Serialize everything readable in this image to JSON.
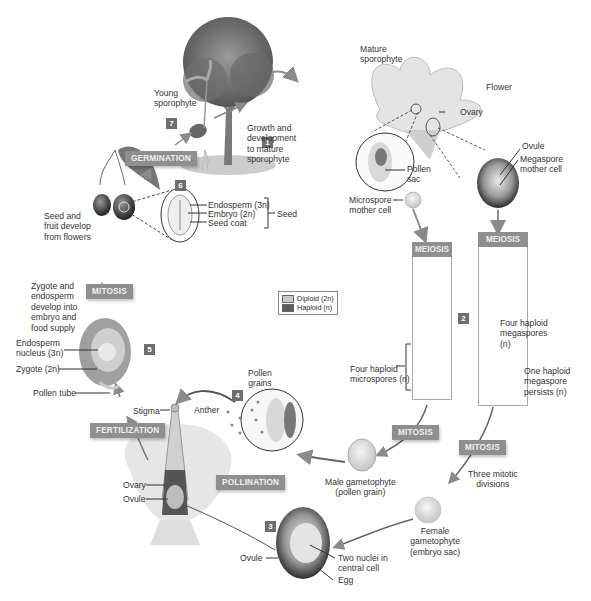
{
  "legend": {
    "items": [
      {
        "label": "Diploid (2n)",
        "color": "#c8c8c8"
      },
      {
        "label": "Haploid (n)",
        "color": "#5c5c5c"
      }
    ]
  },
  "steps": [
    "1",
    "2",
    "3",
    "4",
    "5",
    "6",
    "7"
  ],
  "processes": {
    "germination": "GERMINATION",
    "meiosis_left": "MEIOSIS",
    "meiosis_right": "MEIOSIS",
    "mitosis_left": "MITOSIS",
    "mitosis_center": "MITOSIS",
    "mitosis_right": "MITOSIS",
    "fertilization": "FERTILIZATION",
    "pollination": "POLLINATION"
  },
  "labels": {
    "young_sporophyte": [
      "Young",
      "sporophyte"
    ],
    "growth": [
      "Growth and",
      "development",
      "to mature",
      "sporophyte"
    ],
    "mature_sporophyte": [
      "Mature",
      "sporophyte"
    ],
    "flower": "Flower",
    "ovary_top": "Ovary",
    "ovule_top": "Ovule",
    "megaspore_mother": [
      "Megaspore",
      "mother cell"
    ],
    "pollen_sac": [
      "Pollen",
      "sac"
    ],
    "microspore_mother": [
      "Microspore",
      "mother cell"
    ],
    "seed_fruit": [
      "Seed and",
      "fruit develop",
      "from flowers"
    ],
    "endosperm": "Endosperm (3n)",
    "embryo": "Embryo (2n)",
    "seed_coat": "Seed coat",
    "seed": "Seed",
    "zygote_endosperm": [
      "Zygote and",
      "endosperm",
      "develop into",
      "embryo and",
      "food supply"
    ],
    "endosperm_nucleus": [
      "Endosperm",
      "nucleus (3n)"
    ],
    "zygote": "Zygote (2n)",
    "pollen_tube": "Pollen tube",
    "four_haploid_megaspores": [
      "Four haploid",
      "megaspores",
      "(n)"
    ],
    "one_haploid_megaspore": [
      "One haploid",
      "megaspore",
      "persists (n)"
    ],
    "four_haploid_microspores": [
      "Four haploid",
      "microspores (n)"
    ],
    "pollen_grains": [
      "Pollen",
      "grains"
    ],
    "stigma": "Stigma",
    "anther": "Anther",
    "ovary_bottom": "Ovary",
    "ovule_bottom": "Ovule",
    "male_gametophyte": [
      "Male gametophyte",
      "(pollen grain)"
    ],
    "three_mitotic": [
      "Three mitotic",
      "divisions"
    ],
    "female_gametophyte": [
      "Female",
      "gametophyte",
      "(embryo sac)"
    ],
    "ovule_3": "Ovule",
    "two_nuclei": [
      "Two nuclei in",
      "central cell"
    ],
    "egg": "Egg"
  }
}
